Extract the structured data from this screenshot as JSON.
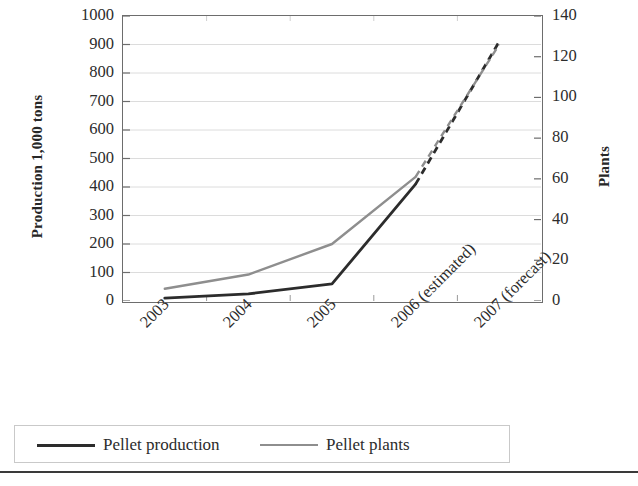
{
  "chart_data": {
    "type": "line",
    "title": "",
    "subtitle": "",
    "categories": [
      "2003",
      "2004",
      "2005",
      "2006 (estimated)",
      "2007 (forecast)"
    ],
    "xlabel": "",
    "grid": true,
    "legend_position": "bottom",
    "axes": {
      "left": {
        "label": "Production 1,000 tons",
        "ylim": [
          0,
          1000
        ],
        "ticks": [
          0,
          100,
          200,
          300,
          400,
          500,
          600,
          700,
          800,
          900,
          1000
        ],
        "tick_labels": [
          "0",
          "100",
          "200",
          "300",
          "400",
          "500",
          "600",
          "700",
          "800",
          "900",
          "1000"
        ]
      },
      "right": {
        "label": "Plants",
        "ylim": [
          0,
          140
        ],
        "ticks": [
          0,
          20,
          40,
          60,
          80,
          100,
          120,
          140
        ],
        "tick_labels": [
          "0",
          "20",
          "40",
          "60",
          "80",
          "100",
          "120",
          "140"
        ]
      }
    },
    "series": [
      {
        "name": "Pellet production",
        "axis": "left",
        "color": "#2c2c2c",
        "values": [
          10,
          25,
          60,
          410,
          910
        ],
        "solid_through": "2006 (estimated)",
        "dashed_from": "2006 (estimated)"
      },
      {
        "name": "Pellet plants",
        "axis": "right",
        "color": "#8e8e8e",
        "values": [
          6,
          13,
          28,
          61,
          126
        ],
        "solid_through": "2006 (estimated)",
        "dashed_from": "2006 (estimated)"
      }
    ],
    "annotations": []
  },
  "legend": {
    "entries": [
      {
        "label": "Pellet production",
        "swatch": "solid-dark-line"
      },
      {
        "label": "Pellet plants",
        "swatch": "solid-gray-line"
      }
    ]
  }
}
